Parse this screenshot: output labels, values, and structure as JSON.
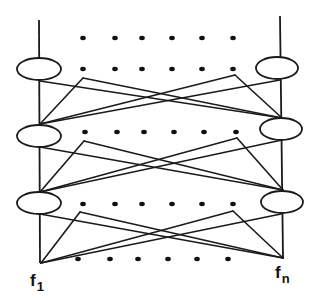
{
  "diagram": {
    "stroke_color": "#1a1a1a",
    "dot_color": "#111111",
    "labels": {
      "left": {
        "base": "f",
        "sub": "1"
      },
      "right": {
        "base": "f",
        "sub": "n"
      }
    },
    "left_column": {
      "line_top": [
        39,
        20
      ],
      "line_bottom": [
        40,
        263
      ],
      "nodes": [
        {
          "cx": 39,
          "cy": 69,
          "rx": 22,
          "ry": 11
        },
        {
          "cx": 39,
          "cy": 136,
          "rx": 22,
          "ry": 11
        },
        {
          "cx": 39,
          "cy": 203,
          "rx": 22,
          "ry": 11
        }
      ]
    },
    "right_column": {
      "line_top": [
        280,
        16
      ],
      "line_bottom": [
        283,
        258
      ],
      "nodes": [
        {
          "cx": 277,
          "cy": 68,
          "rx": 21,
          "ry": 11
        },
        {
          "cx": 281,
          "cy": 129,
          "rx": 21,
          "ry": 11
        },
        {
          "cx": 282,
          "cy": 202,
          "rx": 21,
          "ry": 11
        }
      ]
    },
    "dot_rows": [
      {
        "y": 38,
        "xs": [
          83,
          115,
          142,
          172,
          202,
          233
        ]
      },
      {
        "y": 69,
        "xs": [
          83,
          115,
          142,
          172,
          202,
          233
        ]
      },
      {
        "y": 132,
        "xs": [
          85,
          117,
          144,
          174,
          204,
          236
        ]
      },
      {
        "y": 204,
        "xs": [
          83,
          115,
          142,
          172,
          202,
          233
        ]
      },
      {
        "y": 259,
        "xs": [
          78,
          110,
          138,
          168,
          197,
          228
        ]
      }
    ],
    "crossing_sections": [
      {
        "left_top": [
          40,
          81
        ],
        "left_peak": [
          83,
          78
        ],
        "left_bottom": [
          40,
          124
        ],
        "right_top": [
          280,
          80
        ],
        "right_peak": [
          235,
          75
        ],
        "right_bottom": [
          282,
          118
        ]
      },
      {
        "left_top": [
          40,
          147
        ],
        "left_peak": [
          84,
          141
        ],
        "left_bottom": [
          40,
          192
        ],
        "right_top": [
          282,
          140
        ],
        "right_peak": [
          237,
          138
        ],
        "right_bottom": [
          283,
          190
        ]
      },
      {
        "left_top": [
          40,
          214
        ],
        "left_peak": [
          80,
          212
        ],
        "left_bottom": [
          41,
          263
        ],
        "right_top": [
          281,
          214
        ],
        "right_peak": [
          233,
          211
        ],
        "right_bottom": [
          283,
          258
        ]
      }
    ]
  }
}
